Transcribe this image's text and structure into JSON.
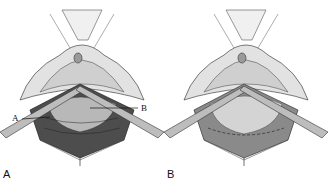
{
  "figure": {
    "panels": [
      {
        "label": "A",
        "callouts": [
          "A",
          "B"
        ],
        "state": "dark tissue layer exposed beneath retractors"
      },
      {
        "label": "B",
        "callouts": [],
        "state": "smooth tissue with sutured margin beneath retractors"
      }
    ],
    "colors": {
      "background": "#ffffff",
      "ink": "#2a2a2a",
      "tissue_light": "#d9d9d9",
      "tissue_mid": "#a8a8a8",
      "tissue_dark": "#4a4a4a"
    }
  }
}
